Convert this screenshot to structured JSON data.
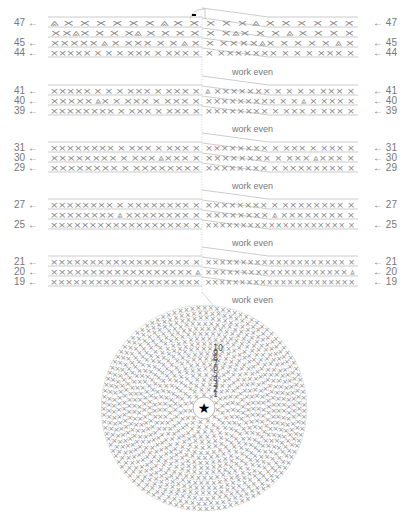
{
  "separator_text": "work even",
  "row_groups": [
    {
      "id": "g44",
      "rows": [
        {
          "num": "47",
          "y": 23,
          "left": "⩓ × ×  ×  × × ×   ⩓  ×  ×",
          "right": "× ×  ×  ⩓  ×   ×   × × × ×"
        },
        {
          "num": "",
          "y": 33,
          "left": "××⩓×  ×  × ×⩓ × × ×  ×",
          "right": "× ×⩓× × ×  ⩓   × × × ×"
        },
        {
          "num": "45",
          "y": 43,
          "left": "×××××  ⩓  × ××× × × ⩓ ×",
          "right": "× ××××⩓× × ×  × × ⩓ ×"
        },
        {
          "num": "44",
          "y": 53,
          "left": "××××× × × × ××× × ××× ×",
          "right": "× ××××××× × ×  × ××× ×"
        }
      ]
    },
    {
      "id": "g39",
      "rows": [
        {
          "num": "41",
          "y": 91,
          "left": "××××× × × × ××× × ××× ×",
          "right": "⩓ ××××××× × × ×  × ××× ×"
        },
        {
          "num": "40",
          "y": 101,
          "left": "××××× ⩓× × ××× × ××× ×",
          "right": "××××××××× × × ⩓  × ××× ×"
        },
        {
          "num": "39",
          "y": 111,
          "left": "×××××××× × ××× × ××× ×",
          "right": "×××××××× × ××× × ××× ×"
        }
      ]
    },
    {
      "id": "g29",
      "rows": [
        {
          "num": "31",
          "y": 148,
          "left": "×××××××× × ××× × ××× ×",
          "right": "×××××××× × ××× × ××× ×"
        },
        {
          "num": "30",
          "y": 158,
          "left": "×××××××× × ××× ⩓××× ×",
          "right": "×××××××× × ××× ⩓××× ×"
        },
        {
          "num": "29",
          "y": 168,
          "left": "×××××××× × ××××××××",
          "right": "×××××××× × ×××××××× ×"
        }
      ]
    },
    {
      "id": "g25",
      "rows": [
        {
          "num": "27",
          "y": 205,
          "left": "×××××××× × ×××××××× ×",
          "right": "×××××××× × ×××××××× ×"
        },
        {
          "num": "",
          "y": 215,
          "left": "×××××××× ⩓ ×××××××× ×",
          "right": "×××××××× ⩓ ×××××××× ×"
        },
        {
          "num": "25",
          "y": 225,
          "left": "×××××××××××××××××× ×",
          "right": "×××××××××××××××××××× ×"
        }
      ]
    },
    {
      "id": "g19",
      "rows": [
        {
          "num": "21",
          "y": 262,
          "left": "×××××××××××××××××× ×",
          "right": "×××××××××××××××××××× ×"
        },
        {
          "num": "20",
          "y": 272,
          "left": "×××××××××××××××××× ⩓",
          "right": "×××××××××××××××××××× ⩓"
        },
        {
          "num": "19",
          "y": 282,
          "left": "××××××××××××××××××××",
          "right": "××××××××××××××××××××××"
        }
      ]
    }
  ],
  "work_even_notes": [
    {
      "y": 72,
      "text": "work even"
    },
    {
      "y": 129,
      "text": "work even"
    },
    {
      "y": 186,
      "text": "work even"
    },
    {
      "y": 243,
      "text": "work even"
    },
    {
      "y": 300,
      "text": "work even"
    }
  ],
  "round_chart": {
    "center_icon": "star-icon",
    "round_numbers": [
      "1",
      "2",
      "3",
      "4",
      "5",
      "6",
      "7",
      "8",
      "9",
      "10"
    ],
    "rounds_count": 18,
    "center": {
      "x": 204,
      "y": 408
    }
  },
  "top_marker": "marker-dash",
  "colors": {
    "line": "#aaaaaa",
    "stitch": "#888888",
    "text": "#777777",
    "star": "#000000"
  }
}
